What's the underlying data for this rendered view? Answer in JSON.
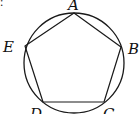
{
  "diagram": {
    "type": "inscribed-pentagon",
    "corner_fragment": ":",
    "circle": {
      "cx": 74,
      "cy": 63,
      "r": 50
    },
    "vertices": [
      {
        "name": "A",
        "x": 74,
        "y": 13
      },
      {
        "name": "B",
        "x": 121,
        "y": 47
      },
      {
        "name": "C",
        "x": 104,
        "y": 102
      },
      {
        "name": "D",
        "x": 43,
        "y": 102
      },
      {
        "name": "E",
        "x": 25,
        "y": 46
      }
    ],
    "labels": {
      "A": "A",
      "B": "B",
      "C": "C",
      "D": "D",
      "E": "E"
    },
    "stroke_color": "#1a1a1a",
    "background": "#ffffff"
  }
}
